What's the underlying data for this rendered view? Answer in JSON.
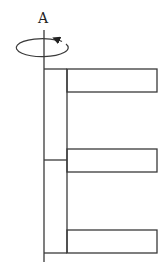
{
  "diagram": {
    "axis_label": "A",
    "colors": {
      "stroke": "#3a3a3a",
      "background": "#ffffff"
    },
    "axis": {
      "x": 44,
      "y_top": 30,
      "y_bottom": 262
    },
    "rotation_arrow": {
      "cx": 44,
      "cy": 48,
      "rx": 26,
      "ry": 9,
      "direction": "counterclockwise-viewed-from-top"
    },
    "spine": {
      "x_left": 44,
      "x_right": 67,
      "y_top": 69,
      "y_bottom": 253,
      "divider_y": 160
    },
    "arms": [
      {
        "name": "top-arm",
        "x_left": 67,
        "x_right": 157,
        "y_top": 69,
        "y_bottom": 92
      },
      {
        "name": "middle-arm",
        "x_left": 67,
        "x_right": 157,
        "y_top": 149,
        "y_bottom": 172
      },
      {
        "name": "bottom-arm",
        "x_left": 67,
        "x_right": 157,
        "y_top": 230,
        "y_bottom": 253
      }
    ]
  }
}
